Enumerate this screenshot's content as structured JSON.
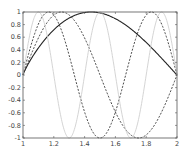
{
  "chart_data": {
    "type": "line",
    "title": "",
    "xlabel": "",
    "ylabel": "",
    "xlim": [
      1,
      2
    ],
    "ylim": [
      -1,
      1
    ],
    "xticks": [
      "1",
      "1.2",
      "1.4",
      "1.6",
      "1.8",
      "2"
    ],
    "yticks": [
      "-1",
      "-0.8",
      "-0.6",
      "-0.4",
      "-0.2",
      "0",
      "0.2",
      "0.4",
      "0.6",
      "0.8",
      "1"
    ],
    "grid": false,
    "series": [
      {
        "name": "solid",
        "style": "solid",
        "color": "#222222",
        "k": 1,
        "exp": 0.85
      },
      {
        "name": "dashed-1",
        "style": "dashed",
        "color": "#333333",
        "k": 2,
        "exp": 1
      },
      {
        "name": "dashed-2",
        "style": "dashed",
        "color": "#333333",
        "k": 3,
        "exp": 1
      },
      {
        "name": "light",
        "style": "solid",
        "color": "#cfcfcf",
        "k": 5,
        "exp": 1
      }
    ]
  }
}
